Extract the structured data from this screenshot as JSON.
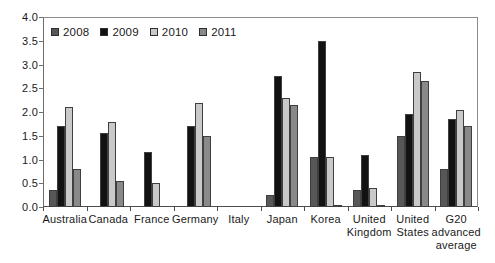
{
  "chart_data": {
    "type": "bar",
    "title": "",
    "xlabel": "",
    "ylabel": "",
    "ylim": [
      0,
      4.0
    ],
    "ytick_labels": [
      "4.0",
      "3.5",
      "3.0",
      "2.5",
      "2.0",
      "1.5",
      "1.0",
      "0.5",
      "0.0"
    ],
    "grid": "off",
    "legend_position": "top-left-inside",
    "categories": [
      "Australia",
      "Canada",
      "France",
      "Germany",
      "Italy",
      "Japan",
      "Korea",
      "United Kingdom",
      "United States",
      "G20 advanced average"
    ],
    "series": [
      {
        "name": "2008",
        "color": "#575757",
        "values": [
          0.35,
          0,
          0,
          0,
          0,
          0.25,
          1.05,
          0.35,
          1.5,
          0.8
        ]
      },
      {
        "name": "2009",
        "color": "#121212",
        "values": [
          1.7,
          1.55,
          1.15,
          1.7,
          0,
          2.75,
          3.5,
          1.1,
          1.95,
          1.85
        ]
      },
      {
        "name": "2010",
        "color": "#c9c9c9",
        "values": [
          2.1,
          1.8,
          0.5,
          2.2,
          0,
          2.3,
          1.05,
          0.4,
          2.85,
          2.05
        ]
      },
      {
        "name": "2011",
        "color": "#898989",
        "values": [
          0.8,
          0.55,
          0,
          1.5,
          0,
          2.15,
          0.05,
          0.05,
          2.65,
          1.7
        ]
      }
    ]
  }
}
